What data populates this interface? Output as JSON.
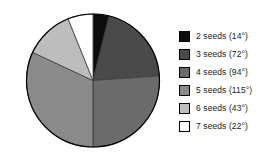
{
  "chart_data": {
    "type": "pie",
    "title": "",
    "subtitle": "",
    "xlabel": "",
    "ylabel": "",
    "grid": false,
    "legend_position": "right",
    "units": "degrees",
    "total_degrees": 360,
    "start_angle_deg": 0,
    "direction": "clockwise",
    "categories": [
      "2 seeds",
      "3 seeds",
      "4 seeds",
      "5 seeds",
      "6 seeds",
      "7 seeds"
    ],
    "values": [
      14,
      72,
      94,
      115,
      43,
      22
    ],
    "value_labels": [
      "14°",
      "72°",
      "94°",
      "115°",
      "43°",
      "22°"
    ],
    "colors": [
      "#0d0d0d",
      "#4a4a4a",
      "#6b6b6b",
      "#8a8a8a",
      "#bdbdbd",
      "#ffffff"
    ],
    "slices": [
      {
        "label": "2 seeds",
        "value": 14,
        "value_label": "14°",
        "color": "#0d0d0d",
        "start_deg": 0,
        "end_deg": 14
      },
      {
        "label": "3 seeds",
        "value": 72,
        "value_label": "72°",
        "color": "#4a4a4a",
        "start_deg": 14,
        "end_deg": 86
      },
      {
        "label": "4 seeds",
        "value": 94,
        "value_label": "94°",
        "color": "#6b6b6b",
        "start_deg": 86,
        "end_deg": 180
      },
      {
        "label": "5 seeds",
        "value": 115,
        "value_label": "115°",
        "color": "#8a8a8a",
        "start_deg": 180,
        "end_deg": 295
      },
      {
        "label": "6 seeds",
        "value": 43,
        "value_label": "43°",
        "color": "#bdbdbd",
        "start_deg": 295,
        "end_deg": 338
      },
      {
        "label": "7 seeds",
        "value": 22,
        "value_label": "22°",
        "color": "#ffffff",
        "start_deg": 338,
        "end_deg": 360
      }
    ]
  },
  "legend": {
    "entries": [
      {
        "label": "2 seeds (14°)",
        "color": "#0d0d0d"
      },
      {
        "label": "3 seeds (72°)",
        "color": "#4a4a4a"
      },
      {
        "label": "4 seeds (94°)",
        "color": "#6b6b6b"
      },
      {
        "label": "5 seeds (115°)",
        "color": "#8a8a8a"
      },
      {
        "label": "6 seeds (43°)",
        "color": "#bdbdbd"
      },
      {
        "label": "7 seeds (22°)",
        "color": "#ffffff"
      }
    ]
  },
  "style": {
    "background": "#ffffff",
    "outline": "#000000",
    "text": "#1a1a1a"
  }
}
